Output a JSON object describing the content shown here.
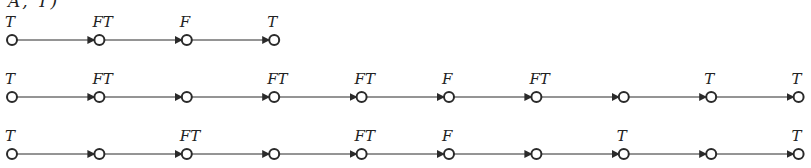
{
  "diagram": {
    "top_fragment": "A, T)",
    "node_spacing": 87.4,
    "first_node_x": 12,
    "colors": {
      "stroke": "#2a2a2a",
      "fill": "#ffffff",
      "text": "#222222"
    },
    "rows": [
      {
        "y": 40,
        "labels": [
          "T",
          "FT",
          "F",
          "T"
        ]
      },
      {
        "y": 97,
        "labels": [
          "T",
          "FT",
          "",
          "FT",
          "FT",
          "F",
          "FT",
          "",
          "T",
          "T"
        ]
      },
      {
        "y": 154,
        "labels": [
          "T",
          "",
          "FT",
          "",
          "FT",
          "F",
          "",
          "T",
          "",
          "T"
        ]
      }
    ]
  }
}
